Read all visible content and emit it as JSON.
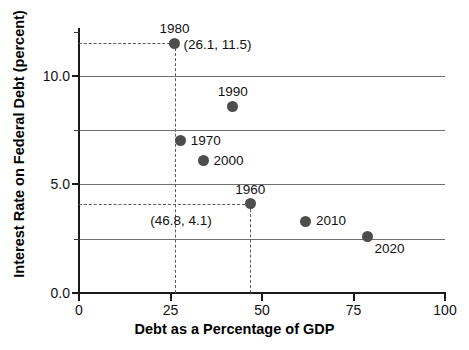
{
  "chart_data": {
    "type": "scatter",
    "title": "",
    "xlabel": "Debt as a Percentage of GDP",
    "ylabel": "Interest Rate on Federal Debt (percent)",
    "xlim": [
      0,
      100
    ],
    "ylim": [
      0,
      12.2
    ],
    "grid": true,
    "legend": "none",
    "x_ticks": [
      {
        "value": 0,
        "label": "0"
      },
      {
        "value": 25,
        "label": "25"
      },
      {
        "value": 50,
        "label": "50"
      },
      {
        "value": 75,
        "label": "75"
      },
      {
        "value": 100,
        "label": "100"
      }
    ],
    "y_ticks_major": [
      {
        "value": 0.0,
        "label": "0.0"
      },
      {
        "value": 5.0,
        "label": "5.0"
      },
      {
        "value": 10.0,
        "label": "10.0"
      }
    ],
    "y_ticks_minor": [
      2.5,
      7.5,
      12.0
    ],
    "gridlines_y": [
      2.5,
      5.0,
      7.5,
      10.0
    ],
    "points": [
      {
        "label": "1980",
        "x": 26.1,
        "y": 11.5,
        "annotation": "(26.1, 11.5)"
      },
      {
        "label": "1990",
        "x": 42.0,
        "y": 8.6,
        "annotation": ""
      },
      {
        "label": "1970",
        "x": 27.8,
        "y": 7.0,
        "annotation": ""
      },
      {
        "label": "2000",
        "x": 34.0,
        "y": 6.1,
        "annotation": ""
      },
      {
        "label": "1960",
        "x": 46.8,
        "y": 4.1,
        "annotation": "(46.8, 4.1)"
      },
      {
        "label": "2010",
        "x": 62.0,
        "y": 3.3,
        "annotation": ""
      },
      {
        "label": "2020",
        "x": 78.8,
        "y": 2.6,
        "annotation": ""
      }
    ],
    "guides": [
      {
        "orientation": "horizontal",
        "value": 11.5,
        "from": 0,
        "to": 26.1
      },
      {
        "orientation": "vertical",
        "value": 26.1,
        "from": 0,
        "to": 11.5
      },
      {
        "orientation": "horizontal",
        "value": 4.1,
        "from": 0,
        "to": 46.8
      },
      {
        "orientation": "vertical",
        "value": 46.8,
        "from": 0,
        "to": 4.1
      }
    ],
    "colors": {
      "point": "#4d4d4d",
      "axis": "#1a1a1a",
      "grid": "#6e6e6e",
      "guide": "#5a5a5a",
      "text": "#111111",
      "background": "#ffffff"
    }
  }
}
